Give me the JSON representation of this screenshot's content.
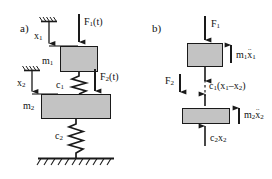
{
  "figure": {
    "width": 272,
    "height": 179,
    "background": "#ffffff",
    "line_color": "#1a1a1a",
    "block_fill": "#c3c3c3"
  },
  "panel_a": {
    "tag": "a)",
    "coordinate_labels": [
      {
        "name": "x1",
        "text": "x",
        "sub": "1"
      },
      {
        "name": "x2",
        "text": "x",
        "sub": "2"
      }
    ],
    "masses": [
      {
        "name": "m1",
        "text": "m",
        "sub": "1"
      },
      {
        "name": "m2",
        "text": "m",
        "sub": "2"
      }
    ],
    "springs": [
      {
        "name": "c1",
        "text": "c",
        "sub": "1"
      },
      {
        "name": "c2",
        "text": "c",
        "sub": "2"
      }
    ],
    "forces": [
      {
        "name": "F1t",
        "text": "F",
        "sub": "1",
        "suffix": "(t)",
        "direction": "down"
      },
      {
        "name": "F2t",
        "text": "F",
        "sub": "2",
        "suffix": "(t)",
        "direction": "down"
      }
    ]
  },
  "panel_b": {
    "tag": "b)",
    "forces": [
      {
        "name": "F1",
        "text": "F",
        "sub": "1",
        "direction": "down"
      },
      {
        "name": "F2",
        "text": "F",
        "sub": "2",
        "direction": "down"
      }
    ],
    "inertia_forces": [
      {
        "name": "m1x1ddot",
        "mass": "m",
        "mass_sub": "1",
        "var": "x",
        "var_sub": "1",
        "dots": "..",
        "direction": "up"
      },
      {
        "name": "m2x2ddot",
        "mass": "m",
        "mass_sub": "2",
        "var": "x",
        "var_sub": "2",
        "dots": "..",
        "direction": "up"
      }
    ],
    "spring_forces": [
      {
        "name": "c1-relative",
        "text": "c",
        "sub": "1",
        "expr": "(x",
        "expr_sub1": "1",
        "minus": "–x",
        "expr_sub2": "2",
        "close": ")",
        "full": "c1(x1–x2)",
        "direction": "down"
      },
      {
        "name": "c2x2",
        "text": "c",
        "sub": "2",
        "var": "x",
        "var_sub": "2",
        "full": "c2x2",
        "direction": "up"
      }
    ]
  }
}
